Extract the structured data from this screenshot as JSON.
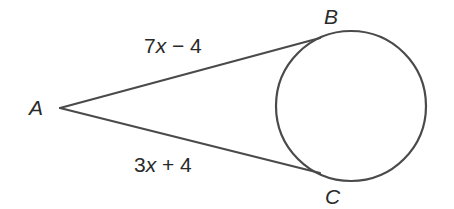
{
  "figure": {
    "type": "tangent-segments-circle",
    "points": {
      "A": {
        "label": "A",
        "x": 58,
        "y": 108
      },
      "B": {
        "label": "B",
        "x": 318,
        "y": 38
      },
      "C": {
        "label": "C",
        "x": 318,
        "y": 173
      }
    },
    "circle": {
      "cx": 351,
      "cy": 106,
      "r": 75
    },
    "segments": [
      {
        "from": "A",
        "to": "B",
        "label_coef": "7",
        "label_var": "x",
        "label_rest": " − 4"
      },
      {
        "from": "A",
        "to": "C",
        "label_coef": "3",
        "label_var": "x",
        "label_rest": " + 4"
      }
    ],
    "colors": {
      "stroke": "#4a4a4a",
      "text": "#2a2a2a",
      "background": "#ffffff"
    }
  }
}
